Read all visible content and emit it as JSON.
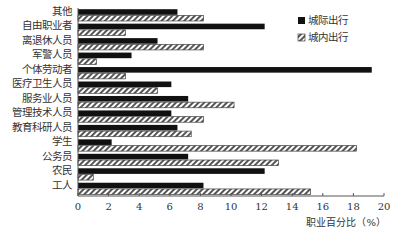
{
  "chart_data": {
    "type": "bar",
    "orientation": "horizontal",
    "title": "",
    "xlabel": "职业百分比（%）",
    "ylabel": "",
    "xlim": [
      0,
      20
    ],
    "x_ticks": [
      0,
      2,
      4,
      6,
      8,
      10,
      12,
      14,
      16,
      18,
      20
    ],
    "grid": false,
    "legend_position": "upper right",
    "categories": [
      "其他",
      "自由职业者",
      "离退休人员",
      "军警人员",
      "个体劳动者",
      "医疗卫生人员",
      "服务业人员",
      "管理技术人员",
      "教育科研人员",
      "学生",
      "公务员",
      "农民",
      "工人"
    ],
    "series": [
      {
        "name": "城际出行",
        "style": "solid",
        "color": "#111111",
        "values": [
          6.5,
          12.2,
          5.2,
          3.5,
          19.2,
          6.1,
          7.2,
          6.1,
          6.5,
          2.2,
          7.2,
          12.2,
          8.2
        ]
      },
      {
        "name": "城内出行",
        "style": "hatched",
        "color": "#555555",
        "values": [
          8.2,
          3.1,
          8.2,
          1.2,
          3.1,
          5.2,
          10.2,
          8.2,
          7.4,
          18.2,
          13.1,
          1.0,
          15.2
        ]
      }
    ]
  }
}
